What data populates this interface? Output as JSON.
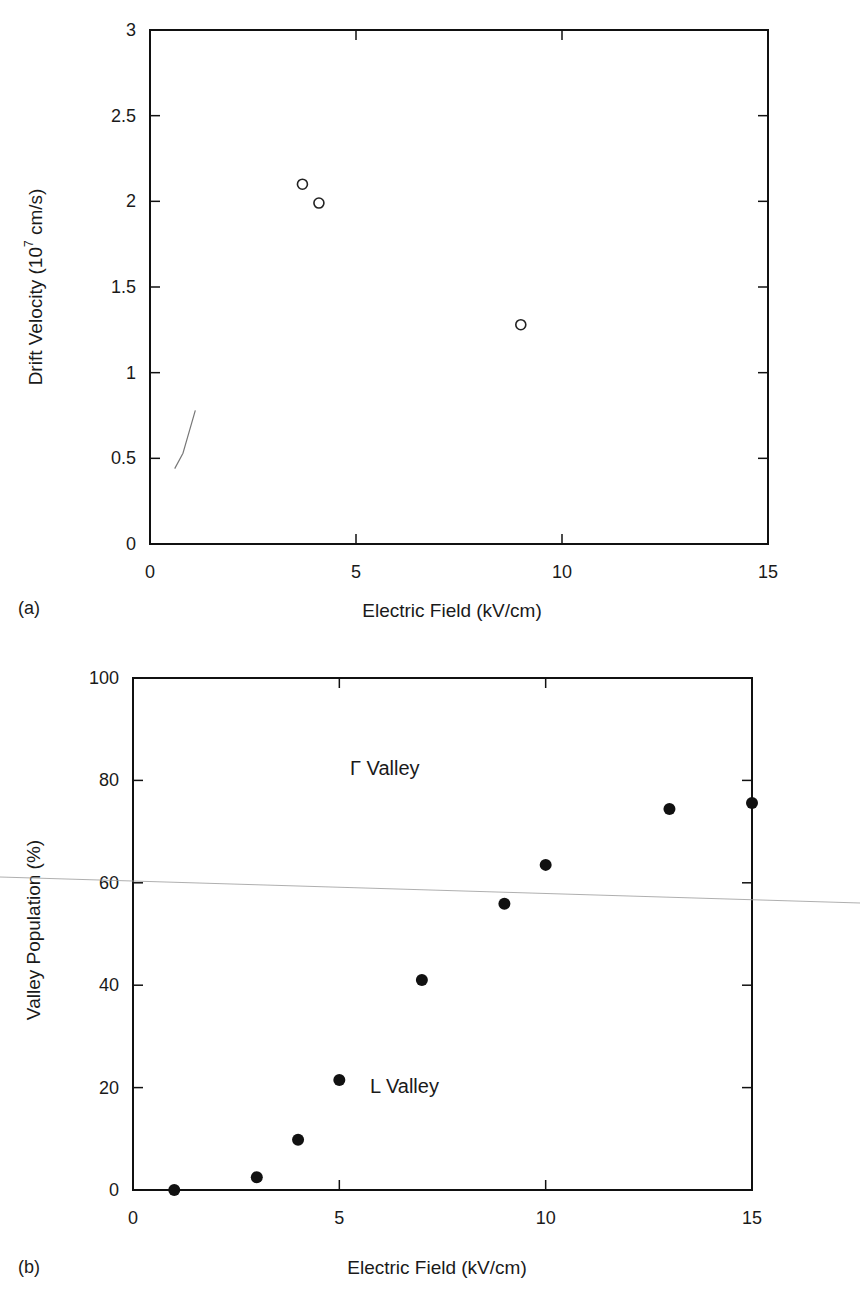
{
  "figure_a": {
    "panel_label": "(a)",
    "xlabel": "Electric Field (kV/cm)",
    "ylabel_main": "Drift Velocity (10",
    "ylabel_exp": "7",
    "ylabel_tail": " cm/s)",
    "xticks": [
      "0",
      "5",
      "10",
      "15"
    ],
    "yticks": [
      "0",
      "0.5",
      "1",
      "1.5",
      "2",
      "2.5",
      "3"
    ]
  },
  "figure_b": {
    "panel_label": "(b)",
    "xlabel": "Electric Field (kV/cm)",
    "ylabel": "Valley Population (%)",
    "xticks": [
      "0",
      "5",
      "10",
      "15"
    ],
    "yticks": [
      "0",
      "20",
      "40",
      "60",
      "80",
      "100"
    ],
    "annotation_gamma": "Γ Valley",
    "annotation_l": "L Valley"
  },
  "chart_data": [
    {
      "type": "scatter",
      "title": "",
      "panel": "(a)",
      "xlabel": "Electric Field (kV/cm)",
      "ylabel": "Drift Velocity (10^7 cm/s)",
      "xlim": [
        0,
        15
      ],
      "ylim": [
        0,
        3
      ],
      "grid": false,
      "legend": null,
      "series": [
        {
          "name": "open-circle markers",
          "marker": "open circle",
          "x": [
            3.7,
            4.1,
            9.0
          ],
          "y": [
            2.1,
            1.99,
            1.28
          ]
        },
        {
          "name": "faint low-field segment",
          "marker": "line",
          "x": [
            0.6,
            0.8,
            1.1
          ],
          "y": [
            0.44,
            0.53,
            0.78
          ]
        }
      ]
    },
    {
      "type": "scatter",
      "title": "",
      "panel": "(b)",
      "xlabel": "Electric Field (kV/cm)",
      "ylabel": "Valley Population (%)",
      "xlim": [
        0,
        15
      ],
      "ylim": [
        0,
        100
      ],
      "grid": false,
      "legend": null,
      "annotations": [
        {
          "text": "Γ Valley",
          "x": 6.6,
          "y": 82
        },
        {
          "text": "L Valley",
          "x": 6.2,
          "y": 20
        }
      ],
      "series": [
        {
          "name": "L Valley population",
          "marker": "filled circle",
          "x": [
            1,
            3,
            4,
            5,
            7,
            9,
            10,
            13,
            15
          ],
          "y": [
            0,
            2.5,
            9.8,
            21.5,
            41,
            55.9,
            63.5,
            74.4,
            75.6
          ]
        }
      ]
    }
  ]
}
